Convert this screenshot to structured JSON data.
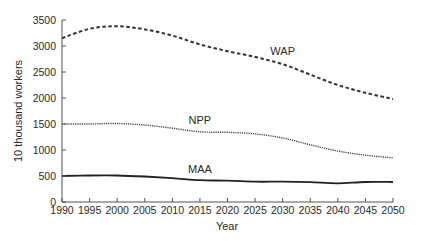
{
  "chart_data": {
    "type": "line",
    "title": "",
    "xlabel": "Year",
    "ylabel": "10 thousand workers",
    "xlim": [
      1990,
      2050
    ],
    "ylim": [
      0,
      3500
    ],
    "grid": false,
    "legend_position": "inline labels",
    "x_ticks": [
      1990,
      1995,
      2000,
      2005,
      2010,
      2015,
      2020,
      2025,
      2030,
      2035,
      2040,
      2045,
      2050
    ],
    "y_ticks": [
      0,
      500,
      1000,
      1500,
      2000,
      2500,
      3000,
      3500
    ],
    "x": [
      1990,
      1995,
      2000,
      2005,
      2010,
      2015,
      2020,
      2025,
      2030,
      2035,
      2040,
      2045,
      2050
    ],
    "series": [
      {
        "name": "WAP",
        "style": "dashed",
        "values": [
          3150,
          3330,
          3380,
          3320,
          3200,
          3030,
          2900,
          2790,
          2650,
          2450,
          2250,
          2100,
          1980
        ],
        "label_position": {
          "x": 2030,
          "y": 2820
        }
      },
      {
        "name": "NPP",
        "style": "dotted",
        "values": [
          1500,
          1500,
          1510,
          1480,
          1420,
          1350,
          1340,
          1310,
          1230,
          1100,
          980,
          900,
          850
        ],
        "label_position": {
          "x": 2015,
          "y": 1500
        }
      },
      {
        "name": "MAA",
        "style": "solid",
        "values": [
          500,
          510,
          510,
          490,
          460,
          420,
          410,
          390,
          390,
          380,
          360,
          385,
          385
        ],
        "label_position": {
          "x": 2015,
          "y": 560
        }
      }
    ]
  }
}
